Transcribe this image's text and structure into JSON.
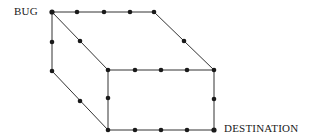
{
  "labels": {
    "start": "BUG",
    "end": "DESTINATION"
  },
  "colors": {
    "line": "#333333",
    "node": "#1a1a1a",
    "background": "#ffffff"
  },
  "diagram": {
    "type": "lattice-box-path"
  }
}
